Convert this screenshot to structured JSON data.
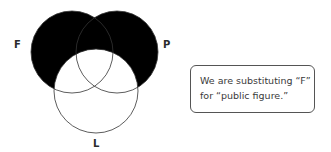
{
  "diagram": {
    "type": "venn",
    "sets": [
      {
        "label": "F"
      },
      {
        "label": "P"
      },
      {
        "label": "L"
      }
    ],
    "shading": "F and P regions shaded black except where they overlap L",
    "colors": {
      "shade": "#000000",
      "outline": "#333333",
      "background": "#ffffff"
    }
  },
  "note": {
    "lines": [
      "We are substituting “F”",
      "for “public figure.”"
    ]
  }
}
